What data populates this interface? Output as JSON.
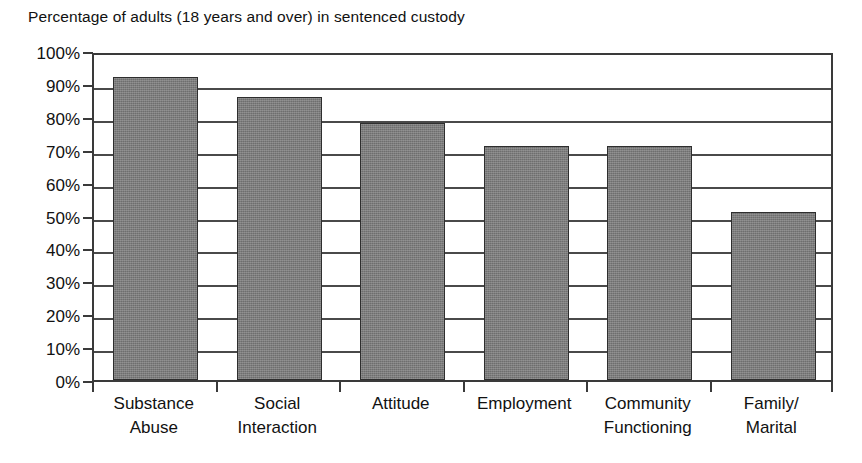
{
  "chart_data": {
    "type": "bar",
    "title": "Percentage of adults (18 years and over) in sentenced custody",
    "xlabel": "",
    "ylabel": "",
    "ylim": [
      0,
      100
    ],
    "ytick_labels": [
      "100%",
      "90%",
      "80%",
      "70%",
      "60%",
      "50%",
      "40%",
      "30%",
      "20%",
      "10%",
      "0%"
    ],
    "ytick_values": [
      100,
      90,
      80,
      70,
      60,
      50,
      40,
      30,
      20,
      10,
      0
    ],
    "grid": true,
    "legend": false,
    "categories": [
      "Substance Abuse",
      "Social Interaction",
      "Attitude",
      "Employment",
      "Community Functioning",
      "Family/ Marital"
    ],
    "category_lines": [
      [
        "Substance",
        "Abuse"
      ],
      [
        "Social",
        "Interaction"
      ],
      [
        "Attitude"
      ],
      [
        "Employment"
      ],
      [
        "Community",
        "Functioning"
      ],
      [
        "Family/",
        "Marital"
      ]
    ],
    "values": [
      92,
      86,
      78,
      71,
      71,
      51
    ],
    "bar_color": "#7c7c7c",
    "bar_border_color": "#2e2e2e",
    "axis_color": "#3a3a3a",
    "background_color": "#ffffff"
  }
}
